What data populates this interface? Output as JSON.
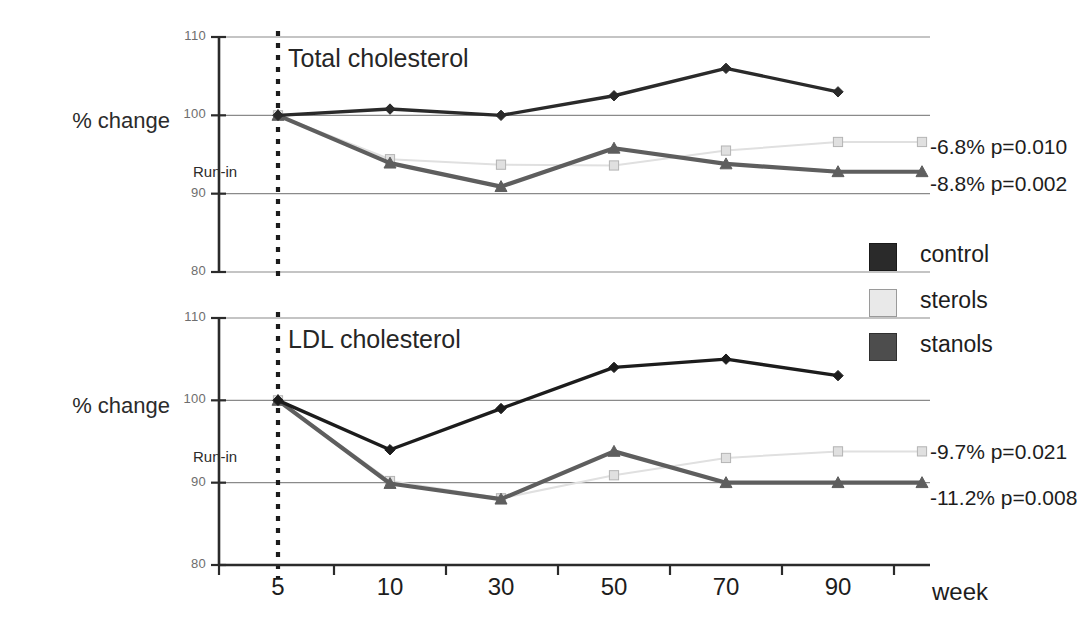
{
  "figure": {
    "y_axis_label": "% change",
    "x_axis_label": "week",
    "runin_label": "Run-in",
    "runin_category": "5"
  },
  "legend": {
    "items": [
      {
        "label": "control",
        "color": "#2a2a2a",
        "marker": "diamond"
      },
      {
        "label": "sterols",
        "color": "#e4e4e4",
        "marker": "square"
      },
      {
        "label": "stanols",
        "color": "#5e5e5e",
        "marker": "triangle"
      }
    ]
  },
  "panels": [
    {
      "title": "Total cholesterol",
      "annotations": [
        {
          "text": "-6.8% p=0.010",
          "series": "sterols"
        },
        {
          "text": "-8.8% p=0.002",
          "series": "stanols"
        }
      ]
    },
    {
      "title": "LDL cholesterol",
      "annotations": [
        {
          "text": "-9.7% p=0.021",
          "series": "sterols"
        },
        {
          "text": "-11.2% p=0.008",
          "series": "stanols"
        }
      ]
    }
  ],
  "chart_data": [
    {
      "type": "line",
      "title": "Total cholesterol",
      "xlabel": "week",
      "ylabel": "% change",
      "categories": [
        "5",
        "10",
        "30",
        "50",
        "70",
        "90"
      ],
      "yticks": [
        80,
        90,
        100,
        110
      ],
      "ylim": [
        80,
        110
      ],
      "grid": true,
      "legend_position": "right",
      "series": [
        {
          "name": "control",
          "color": "#2a2a2a",
          "marker": "diamond",
          "values": [
            100.0,
            100.8,
            100.0,
            102.5,
            106.0,
            103.0
          ]
        },
        {
          "name": "sterols",
          "color": "#e0e0e0",
          "marker": "square",
          "values": [
            100.0,
            94.4,
            93.7,
            93.6,
            95.5,
            96.6
          ]
        },
        {
          "name": "stanols",
          "color": "#5e5e5e",
          "marker": "triangle",
          "values": [
            100.0,
            93.9,
            90.9,
            95.8,
            93.8,
            92.8
          ]
        }
      ],
      "annotations": [
        "-6.8% p=0.010",
        "-8.8% p=0.002"
      ]
    },
    {
      "type": "line",
      "title": "LDL cholesterol",
      "xlabel": "week",
      "ylabel": "% change",
      "categories": [
        "5",
        "10",
        "30",
        "50",
        "70",
        "90"
      ],
      "yticks": [
        80,
        90,
        100,
        110
      ],
      "ylim": [
        80,
        110
      ],
      "grid": true,
      "legend_position": "right",
      "series": [
        {
          "name": "control",
          "color": "#1c1c1c",
          "marker": "diamond",
          "values": [
            100.0,
            94.0,
            99.0,
            104.0,
            105.0,
            103.0
          ]
        },
        {
          "name": "sterols",
          "color": "#e0e0e0",
          "marker": "square",
          "values": [
            100.0,
            90.2,
            88.1,
            90.9,
            93.0,
            93.8
          ]
        },
        {
          "name": "stanols",
          "color": "#5e5e5e",
          "marker": "triangle",
          "values": [
            100.0,
            89.9,
            88.0,
            93.8,
            90.0,
            90.0
          ]
        }
      ],
      "annotations": [
        "-9.7% p=0.021",
        "-11.2% p=0.008"
      ]
    }
  ]
}
